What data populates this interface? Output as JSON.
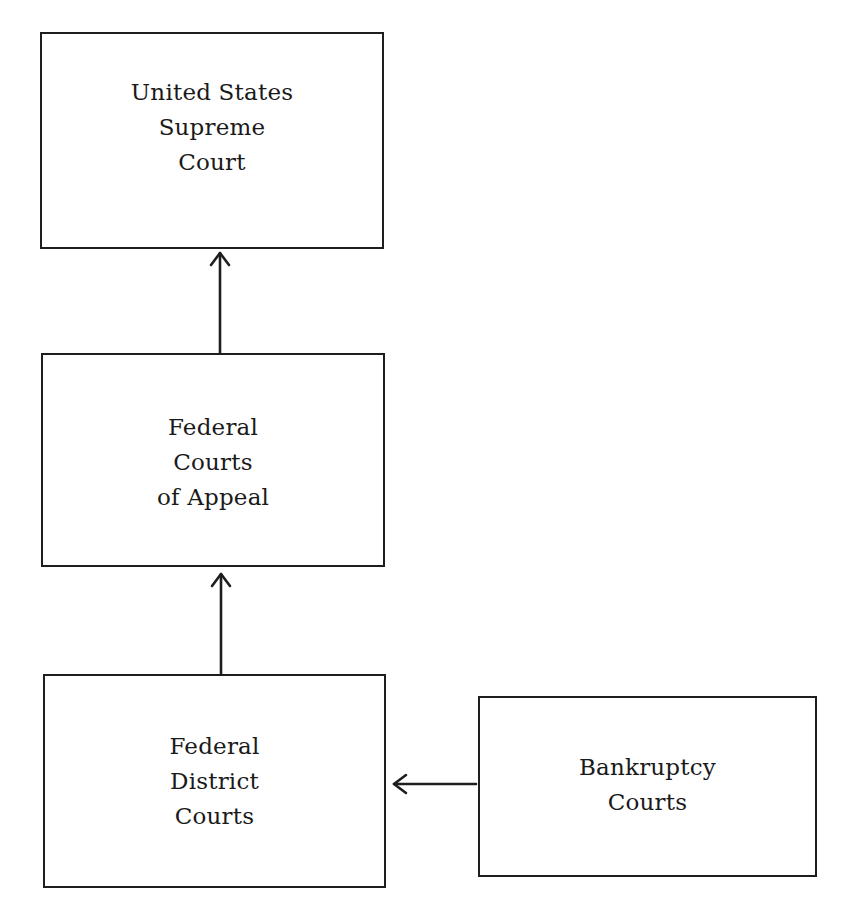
{
  "diagram": {
    "type": "hierarchy-flowchart",
    "colors": {
      "background": "#ffffff",
      "stroke": "#1e1e1e",
      "text": "#1a1a1a"
    },
    "nodes": [
      {
        "id": "supreme",
        "lines": [
          "United States",
          "Supreme",
          "Court"
        ]
      },
      {
        "id": "appeals",
        "lines": [
          "Federal",
          "Courts",
          "of Appeal"
        ]
      },
      {
        "id": "district",
        "lines": [
          "Federal",
          "District",
          "Courts"
        ]
      },
      {
        "id": "bankruptcy",
        "lines": [
          "Bankruptcy",
          "Courts"
        ]
      }
    ],
    "edges": [
      {
        "from": "appeals",
        "to": "supreme",
        "direction": "up"
      },
      {
        "from": "district",
        "to": "appeals",
        "direction": "up"
      },
      {
        "from": "bankruptcy",
        "to": "district",
        "direction": "left"
      }
    ]
  }
}
